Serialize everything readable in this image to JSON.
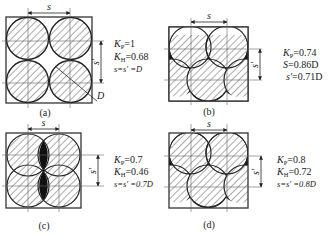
{
  "figure": {
    "panels": [
      {
        "id": "a",
        "caption": "(a)",
        "dim_horizontal": "s",
        "dim_vertical": "s'",
        "dim_diameter": "D",
        "params": [
          {
            "sym": "K",
            "sub": "P",
            "val": "=1"
          },
          {
            "sym": "K",
            "sub": "H",
            "val": "=0.68"
          },
          {
            "sym": "s=s' =D",
            "sub": "",
            "val": ""
          }
        ]
      },
      {
        "id": "b",
        "caption": "(b)",
        "dim_horizontal": "s",
        "dim_vertical": "s'",
        "params": [
          {
            "sym": "K",
            "sub": "P",
            "val": "=0.74"
          },
          {
            "sym": "S",
            "sub": "",
            "val": "=0.86D"
          },
          {
            "sym": "s'",
            "sub": "",
            "val": "=0.71D"
          }
        ]
      },
      {
        "id": "c",
        "caption": "(c)",
        "dim_horizontal": "s",
        "dim_vertical": "s'",
        "params": [
          {
            "sym": "K",
            "sub": "P",
            "val": "=0.7"
          },
          {
            "sym": "K",
            "sub": "H",
            "val": "=0.46"
          },
          {
            "sym": "s=s' =0.7D",
            "sub": "",
            "val": ""
          }
        ]
      },
      {
        "id": "d",
        "caption": "(d)",
        "dim_horizontal": "s",
        "dim_vertical": "s'",
        "params": [
          {
            "sym": "K",
            "sub": "P",
            "val": "=0.8"
          },
          {
            "sym": "K",
            "sub": "H",
            "val": "=0.72"
          },
          {
            "sym": "s=s' =0.8D",
            "sub": "",
            "val": ""
          }
        ]
      }
    ]
  }
}
